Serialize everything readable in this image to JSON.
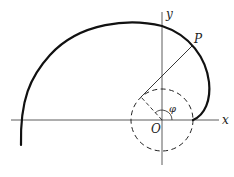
{
  "diagram": {
    "labels": {
      "x_axis": "x",
      "y_axis": "y",
      "origin": "O",
      "point": "P",
      "angle": "φ"
    },
    "colors": {
      "stroke": "#1a1a1a",
      "background": "#ffffff"
    }
  }
}
